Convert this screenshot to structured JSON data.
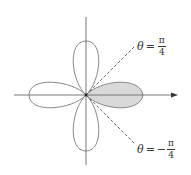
{
  "diagram": {
    "type": "polar rose (four-leaf)",
    "shaded_petal": "right",
    "colors": {
      "curve": "#7a7a7a",
      "axis": "#6a6a6a",
      "shade_fill": "#d9d9d9",
      "dashed": "#5a5a5a",
      "text": "#333333"
    }
  },
  "labels": {
    "upper": {
      "theta": "θ",
      "eq": "=",
      "sign": "",
      "numerator": "π",
      "denominator": "4"
    },
    "lower": {
      "theta": "θ",
      "eq": "=",
      "sign": "−",
      "numerator": "π",
      "denominator": "4"
    }
  }
}
